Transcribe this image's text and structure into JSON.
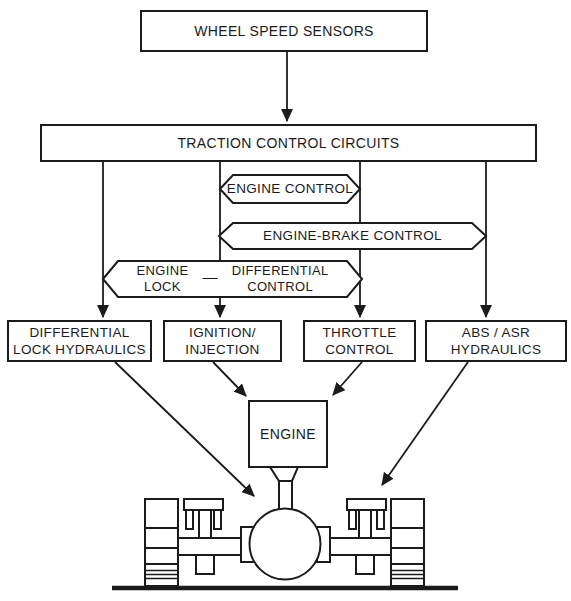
{
  "diagram": {
    "colors": {
      "ink": "#1b1b1b",
      "background": "#ffffff"
    },
    "nodes": {
      "wheel_speed_sensors": {
        "label": "WHEEL SPEED SENSORS"
      },
      "traction_control_circuits": {
        "label": "TRACTION CONTROL CIRCUITS"
      },
      "engine_control": {
        "label": "ENGINE CONTROL"
      },
      "engine_brake_control": {
        "label": "ENGINE-BRAKE CONTROL"
      },
      "engine_lock_differential_control": {
        "left_line1": "ENGINE",
        "left_line2": "LOCK",
        "separator": "—",
        "right_line1": "DIFFERENTIAL",
        "right_line2": "CONTROL"
      },
      "differential_lock_hydraulics": {
        "line1": "DIFFERENTIAL",
        "line2": "LOCK HYDRAULICS"
      },
      "ignition_injection": {
        "line1": "IGNITION/",
        "line2": "INJECTION"
      },
      "throttle_control": {
        "line1": "THROTTLE",
        "line2": "CONTROL"
      },
      "abs_asr_hydraulics": {
        "line1": "ABS / ASR",
        "line2": "HYDRAULICS"
      },
      "engine": {
        "label": "ENGINE"
      }
    },
    "edges": [
      {
        "from": "wheel_speed_sensors",
        "to": "traction_control_circuits"
      },
      {
        "from": "traction_control_circuits",
        "to": "differential_lock_hydraulics"
      },
      {
        "from": "traction_control_circuits",
        "to": "ignition_injection"
      },
      {
        "from": "traction_control_circuits",
        "to": "throttle_control"
      },
      {
        "from": "traction_control_circuits",
        "to": "abs_asr_hydraulics"
      },
      {
        "from": "ignition_injection",
        "to": "engine"
      },
      {
        "from": "throttle_control",
        "to": "engine"
      },
      {
        "from": "differential_lock_hydraulics",
        "to": "axle_differential"
      },
      {
        "from": "abs_asr_hydraulics",
        "to": "axle_brake_unit"
      },
      {
        "from": "engine",
        "to": "axle_differential"
      }
    ]
  }
}
